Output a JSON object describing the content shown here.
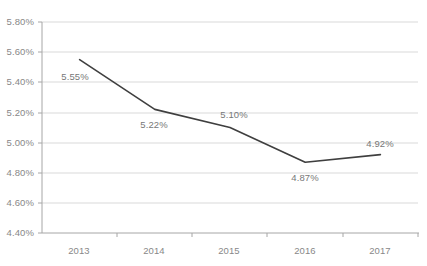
{
  "chart_data": {
    "type": "line",
    "title": "",
    "subtitle": "",
    "xlabel": "",
    "ylabel": "",
    "categories": [
      "2013",
      "2014",
      "2015",
      "2016",
      "2017"
    ],
    "values": [
      5.55,
      5.22,
      5.1,
      4.87,
      4.92
    ],
    "data_labels": [
      "5.55%",
      "5.22%",
      "5.10%",
      "4.87%",
      "4.92%"
    ],
    "ylim": [
      4.4,
      5.8
    ],
    "ytick_step": 0.2,
    "ytick_labels": [
      "5.80%",
      "5.60%",
      "5.40%",
      "5.20%",
      "5.00%",
      "4.80%",
      "4.60%",
      "4.40%"
    ],
    "ytick_values": [
      5.8,
      5.6,
      5.4,
      5.2,
      5.0,
      4.8,
      4.6,
      4.4
    ],
    "xtick_labels": [
      "2013",
      "2014",
      "2015",
      "2016",
      "2017"
    ],
    "grid": "horizontal-only",
    "legend": "none",
    "series": [
      {
        "name": "",
        "values": [
          5.55,
          5.22,
          5.1,
          4.87,
          4.92
        ]
      }
    ],
    "colors": {
      "line": "#3f3f3f",
      "gridline": "#d9d9d9",
      "axis": "#a6a6a6",
      "tick_text": "#888888",
      "data_label_text": "#777777",
      "background": "#ffffff"
    },
    "annotations": []
  }
}
